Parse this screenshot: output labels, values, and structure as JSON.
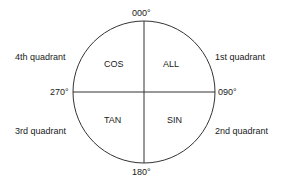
{
  "bearings": {
    "north": "000°",
    "east": "090°",
    "south": "180°",
    "west": "270°"
  },
  "quadrants": {
    "top_left": {
      "name": "4th quadrant",
      "rule": "COS"
    },
    "top_right": {
      "name": "1st quadrant",
      "rule": "ALL"
    },
    "bottom_left": {
      "name": "3rd quadrant",
      "rule": "TAN"
    },
    "bottom_right": {
      "name": "2nd quadrant",
      "rule": "SIN"
    }
  },
  "colors": {
    "stroke": "#333333",
    "text": "#1a1a1a"
  }
}
